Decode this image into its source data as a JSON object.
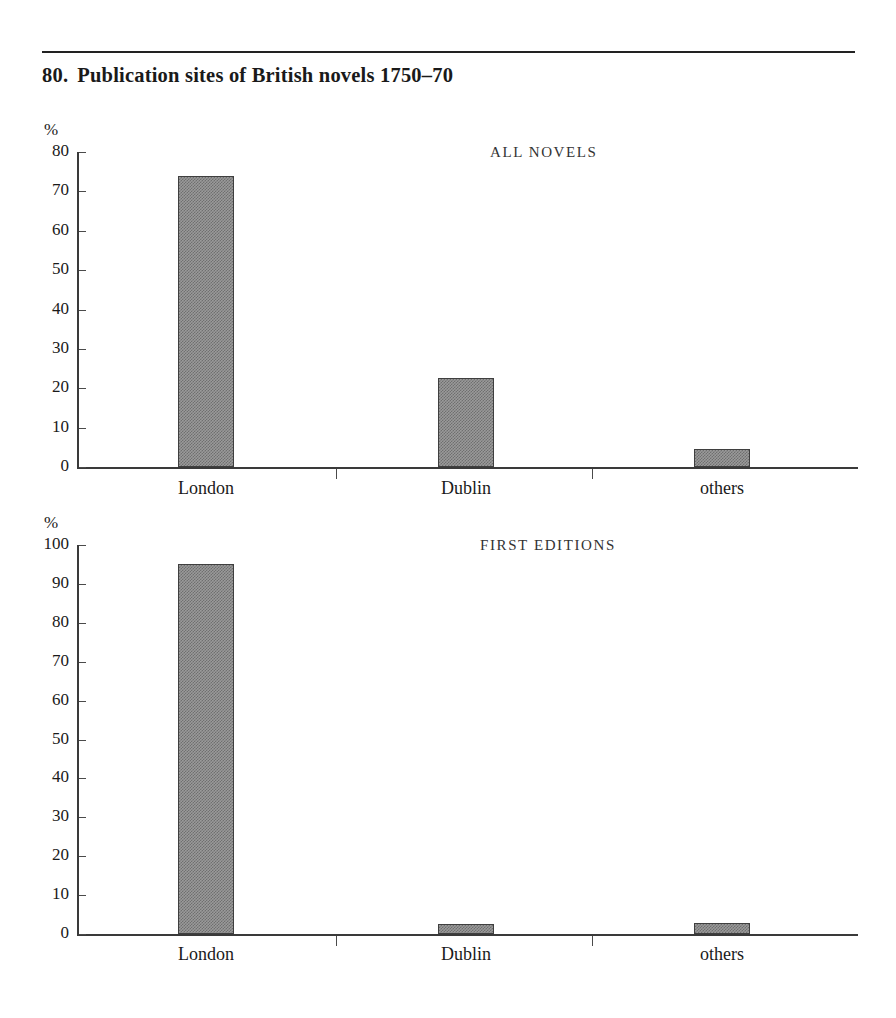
{
  "figure": {
    "number": "80.",
    "title": "Publication sites of British novels 1750–70"
  },
  "chart_data": [
    {
      "type": "bar",
      "title": "ALL NOVELS",
      "categories": [
        "London",
        "Dublin",
        "others"
      ],
      "values": [
        74,
        22.5,
        4.5
      ],
      "xlabel": "",
      "ylabel": "%",
      "ylim": [
        0,
        80
      ],
      "yticks": [
        0,
        10,
        20,
        30,
        40,
        50,
        60,
        70,
        80
      ],
      "ytick_labels": [
        "0",
        "10",
        "20",
        "30",
        "40",
        "50",
        "60",
        "70",
        "80"
      ],
      "grid": false,
      "legend": "none"
    },
    {
      "type": "bar",
      "title": "FIRST EDITIONS",
      "categories": [
        "London",
        "Dublin",
        "others"
      ],
      "values": [
        95,
        2.5,
        2.7
      ],
      "xlabel": "",
      "ylabel": "%",
      "ylim": [
        0,
        100
      ],
      "yticks": [
        0,
        10,
        20,
        30,
        40,
        50,
        60,
        70,
        80,
        90,
        100
      ],
      "ytick_labels": [
        "0",
        "10",
        "20",
        "30",
        "40",
        "50",
        "60",
        "70",
        "80",
        "90",
        "100"
      ],
      "grid": false,
      "legend": "none"
    }
  ],
  "style": {
    "bar_fill": "#808080",
    "bar_border": "#3f3f3f",
    "axis_color": "#3a3a3a",
    "text_color": "#1a1a1a",
    "background": "#ffffff"
  }
}
